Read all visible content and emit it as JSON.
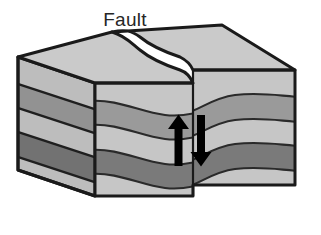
{
  "figure": {
    "type": "geologic-block-diagram",
    "title": "Fault",
    "label": "Fault",
    "background_color": "#ffffff",
    "outline_color": "#1a1a1a"
  },
  "labels": {
    "fault": "Fault"
  },
  "palette": {
    "top_surface": "#c9c9c9",
    "side_face": "#b9b9b9",
    "layer_light": "#c6c6c6",
    "layer_medium": "#9a9a9a",
    "layer_dark": "#7a7a7a",
    "outline": "#1a1a1a",
    "strata_line": "#2a2a2a",
    "arrow": "#000000"
  },
  "strata": [
    {
      "name": "layer-1-light",
      "shade": "light",
      "color": "#c6c6c6"
    },
    {
      "name": "layer-2-medium",
      "shade": "medium",
      "color": "#9a9a9a"
    },
    {
      "name": "layer-3-light",
      "shade": "light",
      "color": "#c6c6c6"
    },
    {
      "name": "layer-4-dark",
      "shade": "dark",
      "color": "#7a7a7a"
    },
    {
      "name": "layer-5-light",
      "shade": "light",
      "color": "#c6c6c6"
    }
  ],
  "fault": {
    "position_x": 193,
    "orientation": "vertical",
    "displacement": "left block up, right block down",
    "arrows": [
      {
        "name": "up-arrow",
        "direction": "up",
        "side": "left-block",
        "x": 178
      },
      {
        "name": "down-arrow",
        "direction": "down",
        "side": "right-block",
        "x": 201
      }
    ]
  },
  "blocks": [
    {
      "name": "left-block",
      "motion": "upthrown"
    },
    {
      "name": "right-block",
      "motion": "downthrown"
    }
  ]
}
